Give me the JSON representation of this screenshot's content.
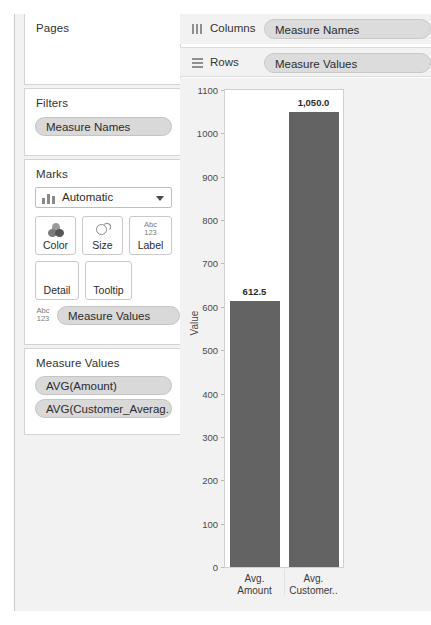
{
  "left_panel": {
    "pages": {
      "title": "Pages"
    },
    "filters": {
      "title": "Filters",
      "pills": [
        "Measure Names"
      ]
    },
    "marks": {
      "title": "Marks",
      "mark_type": "Automatic",
      "mark_type_icon": "bar-chart-icon",
      "caret_icon": "chevron-down-icon",
      "buttons": [
        {
          "label": "Color",
          "icon": "color-palette-icon"
        },
        {
          "label": "Size",
          "icon": "size-circle-icon"
        },
        {
          "label": "Label",
          "icon": "abc123-icon"
        },
        {
          "label": "Detail",
          "icon": ""
        },
        {
          "label": "Tooltip",
          "icon": ""
        }
      ],
      "abc_top": "Abc",
      "abc_bottom": "123",
      "measure_pill": "Measure Values"
    },
    "measure_values": {
      "title": "Measure Values",
      "pills": [
        "AVG(Amount)",
        "AVG(Customer_Averag.."
      ]
    }
  },
  "shelves": {
    "columns": {
      "label": "Columns",
      "icon": "columns-icon",
      "pill": "Measure Names"
    },
    "rows": {
      "label": "Rows",
      "icon": "rows-icon",
      "pill": "Measure Values"
    }
  },
  "colors": {
    "bar": "#636363",
    "pill": "#d9d9d9",
    "shelf_pill": "#dcdcdc",
    "panel_bg": "#f2f2f2",
    "plot_bg": "#ffffff"
  },
  "chart_data": {
    "type": "bar",
    "title": "",
    "xlabel": "",
    "ylabel": "Value",
    "ylim": [
      0,
      1100
    ],
    "ytick_step": 100,
    "yticks": [
      0,
      100,
      200,
      300,
      400,
      500,
      600,
      700,
      800,
      900,
      1000,
      1100
    ],
    "ytick_labels": [
      "0",
      "100",
      "200",
      "300",
      "400",
      "500",
      "600",
      "700",
      "800",
      "900",
      "1000",
      "1100"
    ],
    "categories": [
      "Avg. Amount",
      "Avg. Customer.."
    ],
    "category_lines": [
      [
        "Avg.",
        "Amount"
      ],
      [
        "Avg.",
        "Customer.."
      ]
    ],
    "values": [
      612.5,
      1050.0
    ],
    "data_labels": [
      "612.5",
      "1,050.0"
    ],
    "grid": false,
    "legend": "none"
  }
}
